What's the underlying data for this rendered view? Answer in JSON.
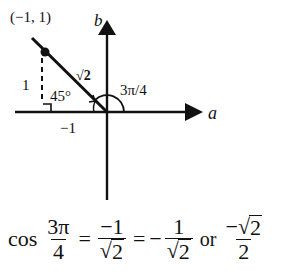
{
  "diagram": {
    "axis_labels": {
      "horizontal": "a",
      "vertical": "b"
    },
    "point_label": "(−1, 1)",
    "hypotenuse_label": "√2",
    "vertical_leg_label": "1",
    "horizontal_leg_label": "−1",
    "reference_angle_label": "45°",
    "angle_label": "3π/4"
  },
  "equation": {
    "func": "cos",
    "arg": {
      "num": "3π",
      "den": "4"
    },
    "eq1": "=",
    "step1": {
      "num": "−1",
      "den_radicand": "2"
    },
    "eq2": "=",
    "neg": "−",
    "step2": {
      "num": "1",
      "den_radicand": "2"
    },
    "or": "or",
    "step3": {
      "num_sign": "−",
      "num_radicand": "2",
      "den": "2"
    },
    "radical": "√"
  },
  "colors": {
    "ink": "#111111",
    "background": "#ffffff"
  }
}
